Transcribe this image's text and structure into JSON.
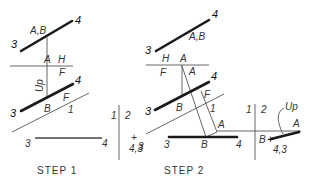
{
  "step1": {
    "caption": "STEP 1",
    "top_view": {
      "end_left": "3",
      "end_right": "4",
      "point_label": "A,B"
    },
    "fold_line_HF": {
      "upper": "H",
      "lower": "F",
      "point": "A"
    },
    "direction_label": "Up",
    "front_view": {
      "end_left": "3",
      "end_right": "4",
      "point": "B",
      "plane": "F"
    },
    "fold_line_F1": {
      "label": "1"
    },
    "aux_view": {
      "end_left": "3",
      "end_right": "4"
    },
    "fold_line_12": {
      "left": "1",
      "right": "2"
    },
    "point_view": {
      "label": "4,3",
      "marker": "+"
    }
  },
  "step2": {
    "caption": "STEP 2",
    "top_view": {
      "end_left": "3",
      "end_right": "4",
      "point_label": "A,B"
    },
    "fold_line_HF": {
      "upper_left": "H",
      "upper_point": "A",
      "lower_left": "F",
      "lower_point": "A"
    },
    "front_view": {
      "end_left": "3",
      "end_right": "4",
      "point": "B",
      "plane": "F"
    },
    "fold_line_F1": {
      "label": "1"
    },
    "aux_view": {
      "end_left": "3",
      "end_right": "4",
      "point_B": "B",
      "point_A": "A"
    },
    "stray_label": "3",
    "fold_line_12": {
      "left": "1",
      "right": "2"
    },
    "point_view": {
      "label": "4,3",
      "marker": "+",
      "point_B": "B",
      "point_A": "A",
      "direction": "Up"
    }
  }
}
